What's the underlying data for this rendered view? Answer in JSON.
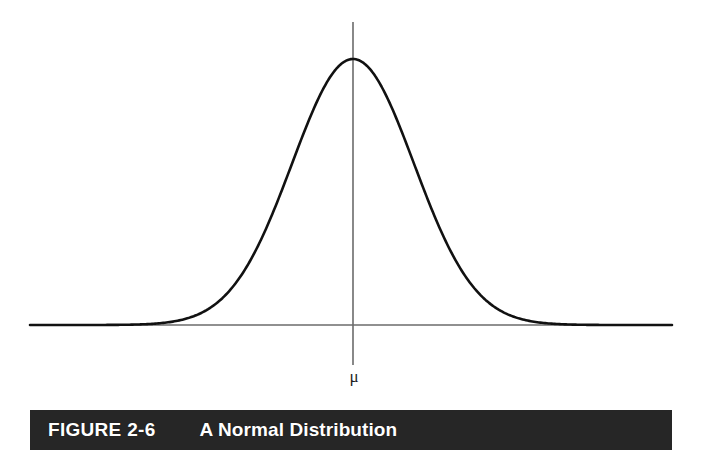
{
  "figure": {
    "number_label": "FIGURE 2-6",
    "title": "A Normal Distribution",
    "mean_symbol": "μ",
    "caption_bar_color": "#262626",
    "caption_text_color": "#ffffff",
    "background_color": "#ffffff",
    "curve_color": "#111111",
    "axis_color": "#6b6b6b"
  },
  "chart_data": {
    "type": "line",
    "title": "A Normal Distribution",
    "subtitle": "",
    "xlabel": "",
    "ylabel": "",
    "legend": [],
    "legend_position": "none",
    "grid": false,
    "annotations": [
      {
        "text": "μ",
        "meaning": "population mean",
        "x": 0,
        "y": 0,
        "placement": "below-x-axis-at-center"
      }
    ],
    "axes": {
      "x_axis_visible": true,
      "y_axis_visible": true,
      "x_tick_labels": [],
      "y_tick_labels": [],
      "xlim": [
        -5.3,
        5.3
      ],
      "ylim": [
        0,
        1.08
      ]
    },
    "distribution": {
      "name": "normal",
      "mean": 0,
      "sigma": 1,
      "peak_height": 1.0
    },
    "x": [
      -5.3,
      -5.0,
      -4.5,
      -4.0,
      -3.5,
      -3.0,
      -2.75,
      -2.5,
      -2.25,
      -2.0,
      -1.75,
      -1.5,
      -1.25,
      -1.0,
      -0.75,
      -0.5,
      -0.25,
      0,
      0.25,
      0.5,
      0.75,
      1.0,
      1.25,
      1.5,
      1.75,
      2.0,
      2.25,
      2.5,
      2.75,
      3.0,
      3.5,
      4.0,
      4.5,
      5.0,
      5.3
    ],
    "values": [
      0.0,
      0.0,
      0.0,
      0.0,
      0.002,
      0.011,
      0.023,
      0.044,
      0.079,
      0.135,
      0.216,
      0.325,
      0.458,
      0.607,
      0.755,
      0.882,
      0.97,
      1.0,
      0.97,
      0.882,
      0.755,
      0.607,
      0.458,
      0.325,
      0.216,
      0.135,
      0.079,
      0.044,
      0.023,
      0.011,
      0.002,
      0.0,
      0.0,
      0.0,
      0.0
    ],
    "series": [
      {
        "name": "normal density",
        "values": [
          0.0,
          0.0,
          0.0,
          0.0,
          0.002,
          0.011,
          0.023,
          0.044,
          0.079,
          0.135,
          0.216,
          0.325,
          0.458,
          0.607,
          0.755,
          0.882,
          0.97,
          1.0,
          0.97,
          0.882,
          0.755,
          0.607,
          0.458,
          0.325,
          0.216,
          0.135,
          0.079,
          0.044,
          0.023,
          0.011,
          0.002,
          0.0,
          0.0,
          0.0,
          0.0
        ]
      }
    ]
  },
  "geometry": {
    "baseline_y": 325,
    "peak_y": 59,
    "center_x": 353,
    "left_x": 30,
    "right_x": 672,
    "vaxis_top_y": 22,
    "vaxis_bottom_y": 365,
    "sigma_px": 61
  }
}
